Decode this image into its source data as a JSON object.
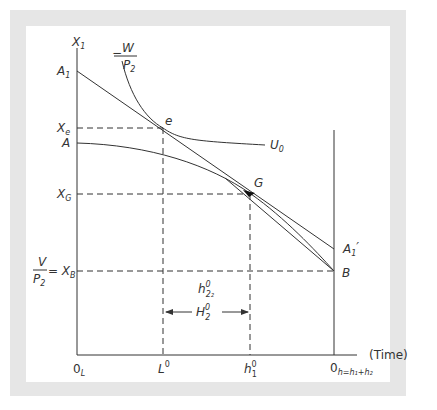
{
  "diagram": {
    "axes": {
      "y_label": "X",
      "y_label_sub": "1",
      "x_label": "(Time)",
      "origin_left": "0",
      "origin_left_sub": "L",
      "origin_right": "0",
      "origin_right_sub": "h=h₁+h₂"
    },
    "y_labels": {
      "A1": "A",
      "A1_sub": "1",
      "Xe": "X",
      "Xe_sub": "e",
      "A": "A",
      "XG": "X",
      "XG_sub": "G",
      "XB_lhs_num": "V",
      "XB_lhs_den": "P",
      "XB_lhs_den_sub": "2",
      "XB_eq": "= X",
      "XB_sub": "B"
    },
    "x_labels": {
      "L0": "L",
      "L0_sup": "0",
      "h1": "h",
      "h1_sup": "0",
      "h1_sub": "1"
    },
    "curve_labels": {
      "wage_minus": "−",
      "wage_num": "W",
      "wage_den": "P",
      "wage_den_sub": "2",
      "U0": "U",
      "U0_sub": "0",
      "e": "e",
      "G": "G",
      "A1_prime": "A",
      "A1_prime_sub": "1",
      "A1_prime_mark": "′",
      "B": "B"
    },
    "annotations": {
      "h22": "h",
      "h22_sup": "0",
      "h22_sub": "2₂",
      "H2": "H",
      "H2_sup": "0",
      "H2_sub": "2"
    },
    "colors": {
      "frame": "#e6e6e6",
      "line": "#333333"
    }
  }
}
